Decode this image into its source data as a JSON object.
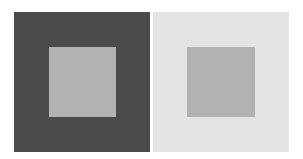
{
  "figure": {
    "left": {
      "outer_color": "#4a4a4a",
      "inner_color": "#b2b2b2"
    },
    "right": {
      "outer_color": "#e4e4e4",
      "inner_color": "#b2b2b2"
    }
  }
}
